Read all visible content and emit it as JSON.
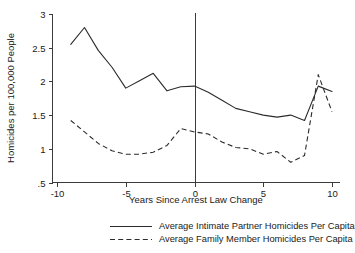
{
  "chart_data": {
    "type": "line",
    "title": "",
    "xlabel": "Years Since Arrest Law Change",
    "ylabel": "Homicides per 100,000 People",
    "xlim": [
      -10,
      10
    ],
    "ylim": [
      0.5,
      3
    ],
    "xticks": [
      -10,
      -5,
      0,
      5,
      10
    ],
    "xtick_labels": [
      "-10",
      "-5",
      "0",
      "5",
      "10"
    ],
    "yticks": [
      0.5,
      1,
      1.5,
      2,
      2.5,
      3
    ],
    "ytick_labels": [
      ".5",
      "1",
      "1.5",
      "2",
      "2.5",
      "3"
    ],
    "grid": false,
    "legend_position": "below-axis",
    "annotations": [
      {
        "type": "vline",
        "x": 0,
        "label": "arrest law change"
      }
    ],
    "x": [
      -9,
      -8,
      -7,
      -6,
      -5,
      -4,
      -3,
      -2,
      -1,
      0,
      1,
      2,
      3,
      4,
      5,
      6,
      7,
      8,
      9,
      10
    ],
    "series": [
      {
        "name": "Average Intimate Partner Homicides Per Capita",
        "style": "solid",
        "values": [
          2.55,
          2.8,
          2.46,
          2.21,
          1.9,
          2.01,
          2.12,
          1.86,
          1.92,
          1.93,
          1.84,
          1.72,
          1.6,
          1.55,
          1.5,
          1.47,
          1.5,
          1.42,
          1.93,
          1.85
        ]
      },
      {
        "name": "Average Family Member Homicides Per Capita",
        "style": "dashed",
        "values": [
          1.42,
          1.25,
          1.08,
          0.97,
          0.92,
          0.92,
          0.95,
          1.05,
          1.3,
          1.25,
          1.22,
          1.1,
          1.02,
          1.0,
          0.92,
          0.96,
          0.8,
          0.9,
          2.1,
          1.55
        ]
      }
    ],
    "legend": [
      {
        "label": "Average Intimate Partner Homicides Per Capita",
        "style": "solid"
      },
      {
        "label": "Average Family Member Homicides Per Capita",
        "style": "dashed"
      }
    ]
  }
}
